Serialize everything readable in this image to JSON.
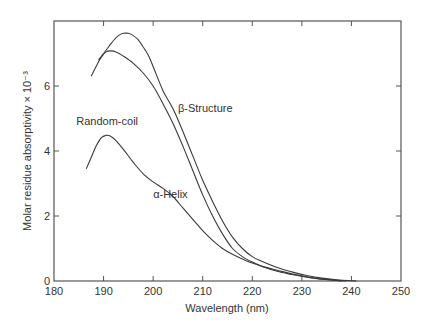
{
  "chart_data": {
    "type": "line",
    "title": "",
    "xlabel": "Wavelength (nm)",
    "ylabel": "Molar residue absorptivity × 10⁻³",
    "xlim": [
      180,
      250
    ],
    "ylim": [
      0,
      8
    ],
    "xticks": [
      180,
      190,
      200,
      210,
      220,
      230,
      240,
      250
    ],
    "yticks": [
      0,
      2,
      4,
      6
    ],
    "grid": false,
    "legend": "inline-labels",
    "series": [
      {
        "name": "β-Structure",
        "label_pos": [
          205,
          5.2
        ],
        "points": [
          [
            189,
            6.8
          ],
          [
            190,
            7.0
          ],
          [
            191,
            7.2
          ],
          [
            192,
            7.4
          ],
          [
            193,
            7.55
          ],
          [
            194,
            7.62
          ],
          [
            195,
            7.62
          ],
          [
            196,
            7.55
          ],
          [
            197,
            7.42
          ],
          [
            198,
            7.2
          ],
          [
            199,
            6.95
          ],
          [
            200,
            6.6
          ],
          [
            202,
            5.85
          ],
          [
            204,
            5.3
          ],
          [
            206,
            4.6
          ],
          [
            208,
            3.85
          ],
          [
            210,
            3.1
          ],
          [
            212,
            2.45
          ],
          [
            214,
            1.85
          ],
          [
            216,
            1.35
          ],
          [
            218,
            1.0
          ],
          [
            220,
            0.75
          ],
          [
            222,
            0.6
          ],
          [
            225,
            0.42
          ],
          [
            228,
            0.28
          ],
          [
            231,
            0.17
          ],
          [
            234,
            0.09
          ],
          [
            237,
            0.04
          ],
          [
            240,
            0.01
          ],
          [
            241,
            0.0
          ]
        ]
      },
      {
        "name": "Random-coil",
        "label_pos": [
          184.5,
          4.8
        ],
        "points": [
          [
            187.5,
            6.3
          ],
          [
            188.5,
            6.6
          ],
          [
            189.5,
            6.88
          ],
          [
            190.5,
            7.05
          ],
          [
            191.5,
            7.08
          ],
          [
            192.5,
            7.05
          ],
          [
            194,
            6.92
          ],
          [
            196,
            6.7
          ],
          [
            198,
            6.4
          ],
          [
            200,
            6.0
          ],
          [
            202,
            5.45
          ],
          [
            204,
            4.85
          ],
          [
            206,
            4.15
          ],
          [
            208,
            3.4
          ],
          [
            210,
            2.65
          ],
          [
            212,
            2.0
          ],
          [
            214,
            1.45
          ],
          [
            216,
            1.0
          ],
          [
            218,
            0.75
          ],
          [
            220,
            0.58
          ],
          [
            222,
            0.45
          ],
          [
            225,
            0.3
          ],
          [
            228,
            0.2
          ],
          [
            231,
            0.12
          ],
          [
            234,
            0.06
          ],
          [
            237,
            0.02
          ],
          [
            238,
            0.0
          ]
        ]
      },
      {
        "name": "α-Helix",
        "label_pos": [
          200,
          2.55
        ],
        "points": [
          [
            186.5,
            3.45
          ],
          [
            187.5,
            3.8
          ],
          [
            188.5,
            4.15
          ],
          [
            189.5,
            4.4
          ],
          [
            190.5,
            4.48
          ],
          [
            191.5,
            4.45
          ],
          [
            192.5,
            4.32
          ],
          [
            194,
            4.05
          ],
          [
            196,
            3.65
          ],
          [
            198,
            3.3
          ],
          [
            200,
            3.05
          ],
          [
            202,
            2.85
          ],
          [
            204,
            2.6
          ],
          [
            206,
            2.25
          ],
          [
            208,
            1.9
          ],
          [
            210,
            1.55
          ],
          [
            212,
            1.25
          ],
          [
            214,
            1.0
          ],
          [
            216,
            0.82
          ],
          [
            218,
            0.68
          ],
          [
            220,
            0.55
          ],
          [
            222,
            0.45
          ],
          [
            225,
            0.33
          ],
          [
            228,
            0.22
          ],
          [
            231,
            0.13
          ],
          [
            234,
            0.06
          ],
          [
            237,
            0.02
          ],
          [
            239,
            0.0
          ]
        ]
      }
    ]
  },
  "colors": {
    "line": "#3a3a3a",
    "axis": "#555555",
    "text": "#333333"
  }
}
